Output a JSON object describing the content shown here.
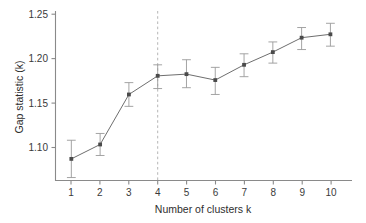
{
  "chart_data": {
    "type": "line",
    "title": "",
    "xlabel": "Number of clusters k",
    "ylabel": "Gap statistic (k)",
    "x": [
      1,
      2,
      3,
      4,
      5,
      6,
      7,
      8,
      9,
      10
    ],
    "categories": [
      "1",
      "2",
      "3",
      "4",
      "5",
      "6",
      "7",
      "8",
      "9",
      "10"
    ],
    "values": [
      1.085,
      1.102,
      1.161,
      1.183,
      1.185,
      1.178,
      1.196,
      1.211,
      1.228,
      1.232
    ],
    "error_low": [
      1.063,
      1.089,
      1.147,
      1.168,
      1.169,
      1.161,
      1.182,
      1.198,
      1.214,
      1.218
    ],
    "error_high": [
      1.107,
      1.115,
      1.175,
      1.196,
      1.202,
      1.193,
      1.209,
      1.223,
      1.24,
      1.245
    ],
    "series": [
      {
        "name": "Gap statistic",
        "values": [
          1.085,
          1.102,
          1.161,
          1.183,
          1.185,
          1.178,
          1.196,
          1.211,
          1.228,
          1.232
        ]
      }
    ],
    "xlim": [
      0.45,
      10.75
    ],
    "ylim": [
      1.0595,
      1.2595
    ],
    "yticks": [
      1.1,
      1.15,
      1.2,
      1.25
    ],
    "ytick_labels": [
      "1.10",
      "1.15",
      "1.20",
      "1.25"
    ],
    "xticks": [
      1,
      2,
      3,
      4,
      5,
      6,
      7,
      8,
      9,
      10
    ],
    "xtick_labels": [
      "1",
      "2",
      "3",
      "4",
      "5",
      "6",
      "7",
      "8",
      "9",
      "10"
    ],
    "grid": false,
    "legend": false,
    "legend_position": "none",
    "annotations": [
      {
        "type": "vertical-dashed-line",
        "name": "optimal-k-reference-line",
        "x": 4,
        "label": ""
      }
    ],
    "colors": {
      "line": "#6e6e6e",
      "marker": "#4a4a4a",
      "errorbar": "#9a9a9a",
      "axis": "#8a8a8a",
      "reference_line": "#b6b6b6",
      "text": "#2e2e2e",
      "background": "#ffffff"
    }
  },
  "axes": {
    "y_title": "Gap statistic (k)",
    "x_title": "Number of clusters k",
    "ytick_labels": [
      "1.25",
      "1.20",
      "1.15",
      "1.10"
    ],
    "xtick_labels": [
      "1",
      "2",
      "3",
      "4",
      "5",
      "6",
      "7",
      "8",
      "9",
      "10"
    ]
  }
}
